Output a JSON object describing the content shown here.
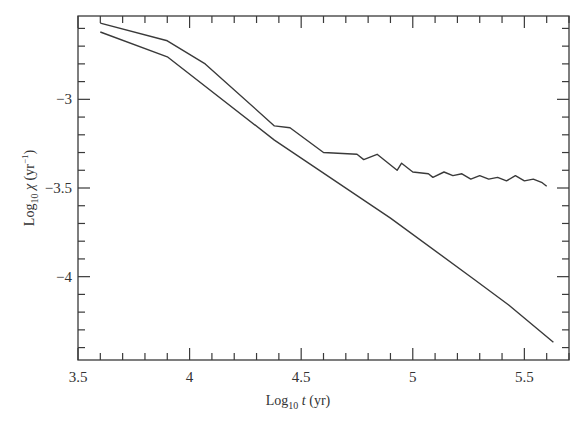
{
  "chart_data": {
    "type": "line",
    "title": "",
    "xlabel": "Log10 t (yr)",
    "ylabel": "Log10 χ (yr⁻¹)",
    "xlim": [
      3.5,
      5.7
    ],
    "ylim": [
      -4.47,
      -2.53
    ],
    "grid": false,
    "legend": null,
    "x_ticks": [
      3.5,
      4,
      4.5,
      5,
      5.5
    ],
    "x_tick_labels": [
      "3.5",
      "4",
      "4.5",
      "5",
      "5.5"
    ],
    "y_ticks": [
      -3,
      -3.5,
      -4
    ],
    "y_tick_labels": [
      "-3",
      "-3.5",
      "-4"
    ],
    "series": [
      {
        "name": "upper",
        "x": [
          3.6,
          3.9,
          4.07,
          4.38,
          4.45,
          4.6,
          4.75,
          4.78,
          4.84,
          4.93,
          4.95,
          5.0,
          5.07,
          5.09,
          5.14,
          5.18,
          5.22,
          5.26,
          5.3,
          5.34,
          5.38,
          5.42,
          5.46,
          5.5,
          5.54,
          5.58,
          5.6
        ],
        "y": [
          -2.57,
          -2.67,
          -2.8,
          -3.15,
          -3.16,
          -3.3,
          -3.31,
          -3.34,
          -3.31,
          -3.4,
          -3.36,
          -3.41,
          -3.42,
          -3.44,
          -3.41,
          -3.43,
          -3.42,
          -3.45,
          -3.43,
          -3.45,
          -3.44,
          -3.46,
          -3.43,
          -3.46,
          -3.45,
          -3.47,
          -3.49
        ]
      },
      {
        "name": "lower",
        "x": [
          3.6,
          3.9,
          4.38,
          4.9,
          5.28,
          5.43,
          5.63
        ],
        "y": [
          -2.62,
          -2.76,
          -3.23,
          -3.67,
          -4.02,
          -4.16,
          -4.37
        ]
      }
    ]
  },
  "axes": {
    "xlabel_main": "Log",
    "xlabel_sub": "10",
    "xlabel_var": " t",
    "xlabel_unit": " (yr)",
    "ylabel_main": "Log",
    "ylabel_sub": "10",
    "ylabel_var": " χ",
    "ylabel_unit": " (yr",
    "ylabel_sup": "−1",
    "ylabel_close": ")"
  }
}
